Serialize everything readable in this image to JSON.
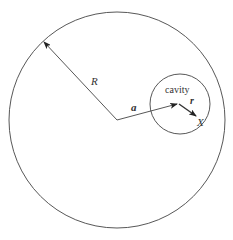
{
  "diagram": {
    "labels": {
      "R": "R",
      "a": "a",
      "r": "r",
      "X": "X",
      "cavity": "cavity"
    },
    "outer_circle": {
      "cx": 117,
      "cy": 120,
      "r": 108
    },
    "cavity_circle": {
      "cx": 180,
      "cy": 104,
      "r": 30
    },
    "colors": {
      "stroke": "#333333",
      "background": "#ffffff"
    }
  }
}
